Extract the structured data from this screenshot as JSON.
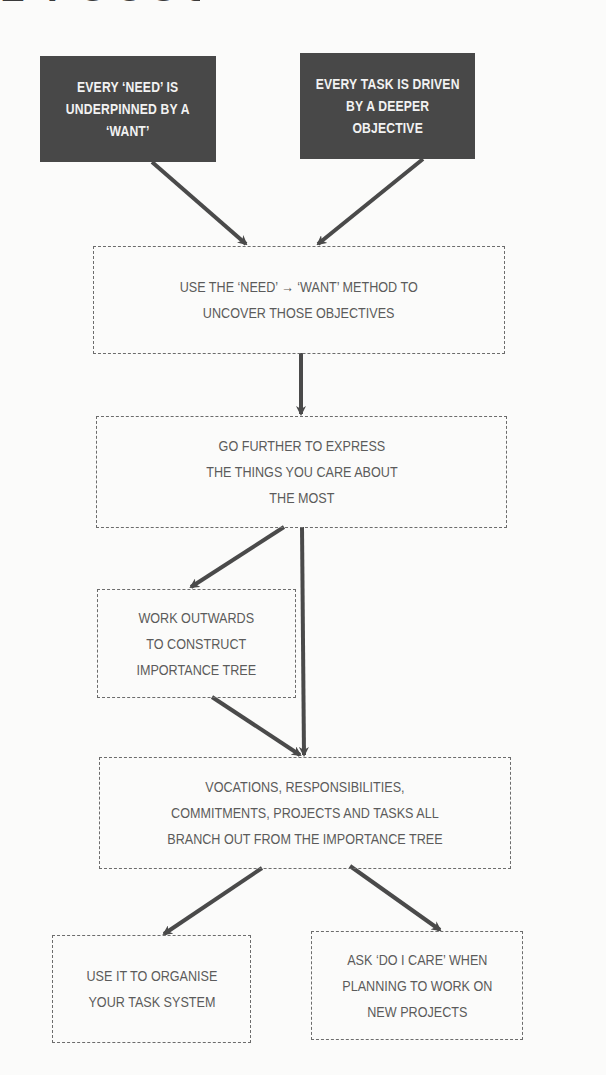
{
  "title_fragment": "L FOCUS",
  "colors": {
    "background": "#fbfbfa",
    "dark_box_fill": "#484848",
    "dark_box_text": "#f2f2f2",
    "dashed_border": "#6c6c6c",
    "body_text": "#5b5b5b",
    "arrow": "#4a4a4a"
  },
  "nodes": {
    "need_want": {
      "lines": [
        "EVERY ‘NEED’ IS",
        "UNDERPINNED BY A",
        "‘WANT’"
      ]
    },
    "deeper_objective": {
      "lines": [
        "EVERY TASK IS DRIVEN",
        "BY A DEEPER",
        "OBJECTIVE"
      ]
    },
    "method": {
      "lines": [
        "USE THE ‘NEED’ → ‘WANT’ METHOD TO",
        "UNCOVER THOSE OBJECTIVES"
      ]
    },
    "go_further": {
      "lines": [
        "GO FURTHER TO EXPRESS",
        "THE THINGS YOU CARE ABOUT",
        "THE MOST"
      ]
    },
    "work_outwards": {
      "lines": [
        "WORK OUTWARDS",
        "TO CONSTRUCT",
        "IMPORTANCE TREE"
      ]
    },
    "vocations": {
      "lines": [
        "VOCATIONS, RESPONSIBILITIES,",
        "COMMITMENTS, PROJECTS AND TASKS ALL",
        "BRANCH OUT FROM THE IMPORTANCE TREE"
      ]
    },
    "organise": {
      "lines": [
        "USE IT TO ORGANISE",
        "YOUR TASK SYSTEM"
      ]
    },
    "do_i_care": {
      "lines": [
        "ASK ‘DO I CARE’ WHEN",
        "PLANNING TO WORK ON",
        "NEW PROJECTS"
      ]
    }
  },
  "edges": [
    {
      "from": "need_want",
      "to": "method"
    },
    {
      "from": "deeper_objective",
      "to": "method"
    },
    {
      "from": "method",
      "to": "go_further"
    },
    {
      "from": "go_further",
      "to": "work_outwards"
    },
    {
      "from": "go_further",
      "to": "vocations"
    },
    {
      "from": "work_outwards",
      "to": "vocations"
    },
    {
      "from": "vocations",
      "to": "organise"
    },
    {
      "from": "vocations",
      "to": "do_i_care"
    }
  ]
}
